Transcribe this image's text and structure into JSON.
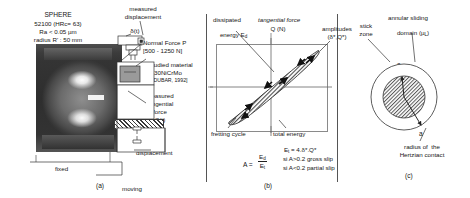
{
  "figure": {
    "panel_a": {
      "label": "(a)",
      "sphere_title": "SPHERE",
      "sphere_line1": "52100 (HRc= 63)",
      "sphere_line2": "Ra < 0.05 µm",
      "sphere_line3": "radius R' : 50 mm",
      "measured_displacement_l1": "measured",
      "measured_displacement_l2": "displacement",
      "measured_displacement_sym": "δ(t)",
      "normal_force_l1": "Normal Force P",
      "normal_force_l2": "[500 - 1250 N]",
      "studied_material_l1": "Studied material",
      "studied_material_l2": "30NiCrMo",
      "studied_material_l3": "[DUBAR, 1992]",
      "tangential_force_l1": "measured",
      "tangential_force_l2": "tangential",
      "tangential_force_l3": "force",
      "tangential_force_sym": "Q(t)",
      "imposed_displacement_l1": "imposed",
      "imposed_displacement_l2": "displacement",
      "fixed_label": "fixed",
      "moving_label": "moving"
    },
    "panel_b": {
      "label": "(b)",
      "dissipated_energy_l1": "dissipated",
      "dissipated_energy_l2": "energy E",
      "dissipated_energy_sub": "d",
      "y_axis_l1": "tangential force",
      "y_axis_l2": "Q (N)",
      "amplitudes_l1": "amplitudes",
      "amplitudes_l2": "(δ*,Q*)",
      "x_axis_l1": "displacement",
      "x_axis_l2": "δ (µm)",
      "fretting_cycle": "fretting cycle",
      "total_energy_l1": "total energy",
      "total_energy_l2": "E",
      "total_energy_sub": "t",
      "total_energy_l3": " = 4.δ*.Q*",
      "ratio_lhs": "A =",
      "ratio_num": "E",
      "ratio_num_sub": "d",
      "ratio_den": "E",
      "ratio_den_sub": "t",
      "cond1": "si A>0.2 gross slip",
      "cond2": "si A<0.2 partial slip"
    },
    "panel_c": {
      "label": "(c)",
      "stick_zone_l1": "stick",
      "stick_zone_l2": "zone",
      "annular_l1": "annular sliding",
      "annular_l2": "domain (µ",
      "annular_sub": "L",
      "annular_l3": ")",
      "radius_c": "c",
      "radius_a": "a",
      "hertz_l1": "radius of  the",
      "hertz_l2": "Hertzian contact"
    }
  },
  "colors": {
    "ink": "#151515",
    "rule": "#8a8a8a",
    "hatch": "#3a3a3a",
    "photo_dark": "#323232"
  }
}
